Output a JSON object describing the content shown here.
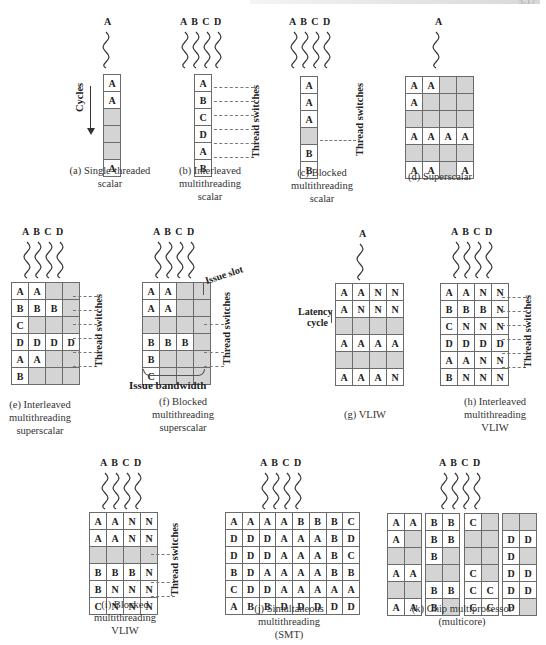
{
  "page_header": {
    "number": "5.17"
  },
  "labels": {
    "cycles": "Cycles",
    "thread_switches": "Thread switches",
    "issue_slot": "Issue slot",
    "issue_bandwidth": "Issue bandwidth",
    "latency_cycle_1": "Latency",
    "latency_cycle_2": "cycle"
  },
  "panels": {
    "a": {
      "threads": "A",
      "caption": [
        "(a) Single-threaded",
        "scalar"
      ],
      "grid": [
        [
          "A"
        ],
        [
          "A"
        ],
        [
          ""
        ],
        [
          ""
        ],
        [
          ""
        ],
        [
          "A"
        ]
      ]
    },
    "b": {
      "threads": "A B C D",
      "caption": [
        "(b) Interleaved",
        "multithreading",
        "scalar"
      ],
      "grid": [
        [
          "A"
        ],
        [
          "B"
        ],
        [
          "C"
        ],
        [
          "D"
        ],
        [
          "A"
        ],
        [
          "B"
        ]
      ]
    },
    "c": {
      "threads": "A B C D",
      "caption": [
        "(c) Blocked",
        "multithreading",
        "scalar"
      ],
      "grid": [
        [
          "A"
        ],
        [
          "A"
        ],
        [
          "A"
        ],
        [
          ""
        ],
        [
          "B"
        ],
        [
          "B"
        ]
      ]
    },
    "d": {
      "threads": "A",
      "caption": [
        "(d) Superscalar"
      ],
      "grid": [
        [
          "A",
          "A",
          "",
          ""
        ],
        [
          "A",
          "",
          "",
          ""
        ],
        [
          "",
          "",
          "",
          ""
        ],
        [
          "A",
          "A",
          "A",
          "A"
        ],
        [
          "",
          "",
          "",
          ""
        ],
        [
          "A",
          "A",
          "",
          "A"
        ]
      ]
    },
    "e": {
      "threads": "A B C D",
      "caption": [
        "(e) Interleaved",
        "multithreading",
        "superscalar"
      ],
      "grid": [
        [
          "A",
          "A",
          "",
          ""
        ],
        [
          "B",
          "B",
          "B",
          ""
        ],
        [
          "C",
          "",
          "",
          ""
        ],
        [
          "D",
          "D",
          "D",
          "D"
        ],
        [
          "A",
          "A",
          "",
          ""
        ],
        [
          "B",
          "",
          "",
          ""
        ]
      ]
    },
    "f": {
      "threads": "A B C D",
      "caption": [
        "(f) Blocked",
        "multithreading",
        "superscalar"
      ],
      "grid": [
        [
          "A",
          "A",
          "",
          ""
        ],
        [
          "A",
          "A",
          "",
          ""
        ],
        [
          "",
          "",
          "",
          ""
        ],
        [
          "B",
          "B",
          "B",
          ""
        ],
        [
          "B",
          "",
          "",
          ""
        ],
        [
          "C",
          "",
          "",
          ""
        ]
      ]
    },
    "g": {
      "threads": "A",
      "caption": [
        "(g) VLIW"
      ],
      "grid": [
        [
          "A",
          "A",
          "N",
          "N"
        ],
        [
          "A",
          "N",
          "N",
          "N"
        ],
        [
          "",
          "",
          "",
          ""
        ],
        [
          "A",
          "A",
          "A",
          "A"
        ],
        [
          "",
          "",
          "",
          ""
        ],
        [
          "A",
          "A",
          "A",
          "N"
        ]
      ]
    },
    "h": {
      "threads": "A B C D",
      "caption": [
        "(h) Interleaved",
        "multithreading",
        "VLIW"
      ],
      "grid": [
        [
          "A",
          "A",
          "N",
          "N"
        ],
        [
          "B",
          "B",
          "B",
          "N"
        ],
        [
          "C",
          "N",
          "N",
          "N"
        ],
        [
          "D",
          "D",
          "D",
          "D"
        ],
        [
          "A",
          "A",
          "N",
          "N"
        ],
        [
          "B",
          "N",
          "N",
          "N"
        ]
      ]
    },
    "i": {
      "threads": "A B C D",
      "caption": [
        "(i) Blocked",
        "multithreading",
        "VLIW"
      ],
      "grid": [
        [
          "A",
          "A",
          "N",
          "N"
        ],
        [
          "A",
          "A",
          "N",
          "N"
        ],
        [
          "",
          "",
          "",
          ""
        ],
        [
          "B",
          "B",
          "B",
          "N"
        ],
        [
          "B",
          "N",
          "N",
          "N"
        ],
        [
          "C",
          "N",
          "N",
          "N"
        ]
      ]
    },
    "j": {
      "threads": "A B C D",
      "caption": [
        "(j) Simultaneous",
        "multithreading",
        "(SMT)"
      ],
      "grid": [
        [
          "A",
          "A",
          "A",
          "A",
          "B",
          "B",
          "B",
          "C"
        ],
        [
          "D",
          "D",
          "D",
          "A",
          "A",
          "A",
          "B",
          "D"
        ],
        [
          "D",
          "D",
          "D",
          "A",
          "A",
          "A",
          "B",
          "C"
        ],
        [
          "B",
          "D",
          "A",
          "A",
          "A",
          "A",
          "B",
          "B"
        ],
        [
          "C",
          "D",
          "D",
          "A",
          "A",
          "A",
          "A",
          "A"
        ],
        [
          "A",
          "B",
          "B",
          "D",
          "D",
          "D",
          "D",
          "D"
        ]
      ]
    },
    "k": {
      "threads": "A B C D",
      "caption": [
        "(k) Chip multiprocessor",
        "(multicore)"
      ],
      "cores": [
        [
          [
            "A",
            "A"
          ],
          [
            "A",
            ""
          ],
          [
            "",
            ""
          ],
          [
            "A",
            "A"
          ],
          [
            "",
            ""
          ],
          [
            "A",
            "A"
          ]
        ],
        [
          [
            "B",
            "B"
          ],
          [
            "B",
            "B"
          ],
          [
            "B",
            ""
          ],
          [
            "",
            ""
          ],
          [
            "B",
            "B"
          ],
          [
            "B",
            ""
          ]
        ],
        [
          [
            "C",
            ""
          ],
          [
            "",
            ""
          ],
          [
            "",
            ""
          ],
          [
            "C",
            ""
          ],
          [
            "C",
            "C"
          ],
          [
            "C",
            "C"
          ]
        ],
        [
          [
            "",
            ""
          ],
          [
            "D",
            "D"
          ],
          [
            "D",
            ""
          ],
          [
            "D",
            "D"
          ],
          [
            "D",
            "D"
          ],
          [
            "D",
            ""
          ]
        ]
      ]
    }
  },
  "colors": {
    "empty_slot": "#d4d4d4",
    "filled_slot": "#ffffff",
    "border": "#6b6b6b"
  }
}
